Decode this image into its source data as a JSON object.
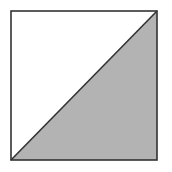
{
  "diagram": {
    "shape": "square-divided-by-diagonal",
    "square": {
      "x": 11,
      "y": 11,
      "width": 146,
      "height": 149
    },
    "diagonal": {
      "from": "bottom-left",
      "to": "top-right"
    },
    "colors": {
      "background": "#ffffff",
      "stroke": "#333333",
      "upper_left_fill": "#ffffff",
      "lower_right_fill": "#b3b3b3"
    }
  }
}
